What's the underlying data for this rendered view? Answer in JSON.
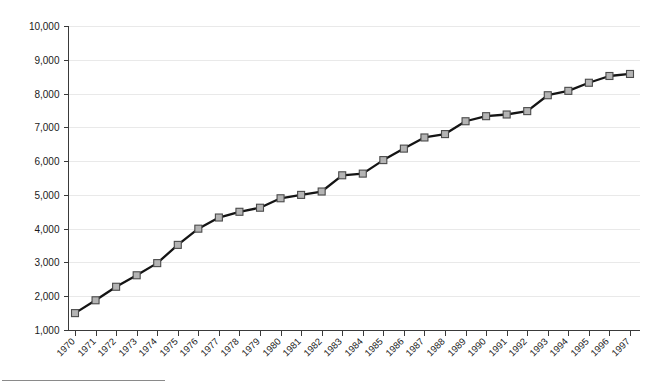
{
  "chart_data": {
    "type": "line",
    "title": "",
    "subtitle": "",
    "xlabel": "",
    "ylabel": "",
    "categories": [
      "1970",
      "1971",
      "1972",
      "1973",
      "1974",
      "1975",
      "1976",
      "1977",
      "1978",
      "1979",
      "1980",
      "1981",
      "1982",
      "1983",
      "1984",
      "1985",
      "1986",
      "1987",
      "1988",
      "1989",
      "1990",
      "1991",
      "1992",
      "1993",
      "1994",
      "1995",
      "1996",
      "1997"
    ],
    "series": [
      {
        "name": "Series 1",
        "values": [
          1500,
          1880,
          2280,
          2620,
          2980,
          3520,
          4000,
          4330,
          4500,
          4620,
          4900,
          5000,
          5100,
          5580,
          5630,
          6030,
          6370,
          6700,
          6800,
          7180,
          7330,
          7380,
          7480,
          7950,
          8080,
          8320,
          8520,
          8580
        ]
      }
    ],
    "ylim": [
      1000,
      10000
    ],
    "ytick_values": [
      1000,
      2000,
      3000,
      4000,
      5000,
      6000,
      7000,
      8000,
      9000,
      10000
    ],
    "ytick_labels": [
      "1,000",
      "2,000",
      "3,000",
      "4,000",
      "5,000",
      "6,000",
      "7,000",
      "8,000",
      "9,000",
      "10,000"
    ],
    "grid": true,
    "grid_axis": "y",
    "legend": false,
    "legend_position": "none",
    "marker": "square",
    "marker_fill": "#b4b4b4",
    "marker_edge": "#4a4a4a",
    "line_color": "#141414",
    "grid_color": "#e9e9e9",
    "axis_color": "#3a3a3a",
    "background": "#ffffff",
    "xtick_label_rotation": -45
  },
  "footer": {
    "rule_present": true
  }
}
